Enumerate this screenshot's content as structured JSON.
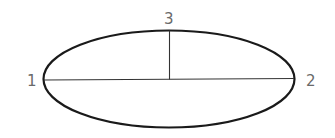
{
  "diagram": {
    "shape": "ellipse",
    "stroke_color": "#1a1a1a",
    "line_color": "#333333",
    "label_color": "#6a6a6a",
    "labels": {
      "point1": "1",
      "point2": "2",
      "point3": "3"
    }
  }
}
